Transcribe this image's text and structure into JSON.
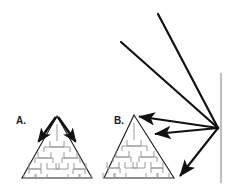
{
  "figure": {
    "background_color": "#ffffff",
    "width": 233,
    "height": 187,
    "colors": {
      "outline": "#1a1a1a",
      "arrow": "#111111",
      "tree": "#9a9a9a",
      "axis_line": "#9a9a9a"
    }
  },
  "panels": [
    {
      "id": "A",
      "label": "A.",
      "label_x": 16,
      "label_y": 124,
      "description": "Pyramid containing a hierarchy tree, with two thick arrows emanating from the apex downward-left and downward-right",
      "triangle": {
        "apex": [
          57,
          116
        ],
        "left": [
          22,
          178
        ],
        "right": [
          92,
          178
        ]
      },
      "tree": {
        "root": [
          57,
          124
        ],
        "levels": 4,
        "stem_bottom": 141,
        "rows": [
          {
            "y": 141,
            "boxes": [
              [
                57,
                141
              ]
            ]
          },
          {
            "y": 152,
            "boxes": [
              [
                44,
                152
              ],
              [
                70,
                152
              ]
            ]
          },
          {
            "y": 163,
            "boxes": [
              [
                35,
                163
              ],
              [
                53,
                163
              ],
              [
                62,
                163
              ],
              [
                80,
                163
              ]
            ]
          },
          {
            "y": 174,
            "boxes": [
              [
                29,
                174
              ],
              [
                41,
                174
              ],
              [
                73,
                174
              ],
              [
                85,
                174
              ]
            ]
          }
        ]
      },
      "arrows": [
        {
          "name": "apex-arrow-left",
          "from": [
            57,
            117
          ],
          "to": [
            37,
            144
          ]
        },
        {
          "name": "apex-arrow-right",
          "from": [
            57,
            117
          ],
          "to": [
            77,
            144
          ]
        }
      ]
    },
    {
      "id": "B",
      "label": "B.",
      "label_x": 114,
      "label_y": 124,
      "description": "Pyramid containing a hierarchy tree, targeted by arrows converging from a source point on the right",
      "triangle": {
        "apex": [
          134,
          115
        ],
        "left": [
          104,
          178
        ],
        "right": [
          174,
          178
        ]
      },
      "tree": {
        "root": [
          134,
          123
        ],
        "levels": 4,
        "stem_bottom": 140,
        "rows": [
          {
            "y": 140,
            "boxes": [
              [
                134,
                140
              ]
            ]
          },
          {
            "y": 151,
            "boxes": [
              [
                122,
                151
              ],
              [
                147,
                151
              ]
            ]
          },
          {
            "y": 162,
            "boxes": [
              [
                113,
                162
              ],
              [
                131,
                162
              ],
              [
                139,
                162
              ],
              [
                157,
                162
              ]
            ]
          },
          {
            "y": 173,
            "boxes": [
              [
                108,
                173
              ],
              [
                120,
                173
              ],
              [
                151,
                173
              ],
              [
                163,
                173
              ]
            ]
          }
        ]
      }
    }
  ],
  "source_point": {
    "name": "convergence-point",
    "x": 218,
    "y": 128
  },
  "incoming_rays": [
    {
      "name": "incoming-ray-upper",
      "from": [
        158,
        14
      ],
      "to": [
        218,
        128
      ],
      "arrowhead": false
    },
    {
      "name": "incoming-ray-lower",
      "from": [
        121,
        42
      ],
      "to": [
        218,
        128
      ],
      "arrowhead": false
    }
  ],
  "outgoing_arrows": [
    {
      "name": "arrow-to-apex-b",
      "from": [
        218,
        128
      ],
      "to": [
        136,
        116
      ],
      "arrowhead": true
    },
    {
      "name": "arrow-to-interior-b",
      "from": [
        218,
        128
      ],
      "to": [
        152,
        134
      ],
      "arrowhead": true
    },
    {
      "name": "arrow-to-lower-right",
      "from": [
        218,
        128
      ],
      "to": [
        178,
        179
      ],
      "arrowhead": true
    }
  ],
  "axis_line": {
    "name": "vertical-reference-line",
    "x": 221,
    "y_top": 73,
    "y_bottom": 183
  }
}
